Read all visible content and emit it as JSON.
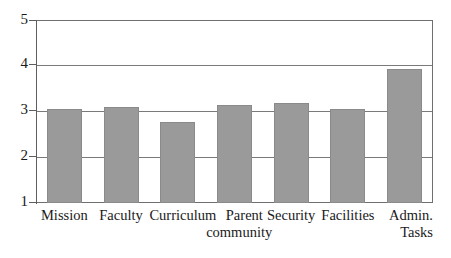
{
  "chart_data": {
    "type": "bar",
    "title": "",
    "subtitle": "",
    "xlabel": "",
    "ylabel": "",
    "categories": [
      "Mission",
      "Faculty",
      "Curriculum",
      "Parent\ncommunity",
      "Security",
      "Facilities",
      "Admin.\nTasks"
    ],
    "values": [
      3.05,
      3.1,
      2.78,
      3.15,
      3.18,
      3.05,
      3.92
    ],
    "ylim": [
      1,
      5
    ],
    "yticks": [
      1,
      2,
      3,
      4,
      5
    ],
    "ytick_labels": [
      "1",
      "2",
      "3",
      "4",
      "5"
    ],
    "grid": true,
    "grid_axis": "y",
    "legend": false,
    "legend_position": "none",
    "bar_color": "#9a9a9a",
    "bar_edge_color": "#8a8a8a",
    "axis_color": "#6f6f6f",
    "gridline_color": "#7a7a7a",
    "background_color": "#ffffff"
  },
  "axes": {
    "y_ticks": [
      {
        "label": "5",
        "value": 5
      },
      {
        "label": "4",
        "value": 4
      },
      {
        "label": "3",
        "value": 3
      },
      {
        "label": "2",
        "value": 2
      },
      {
        "label": "1",
        "value": 1
      }
    ]
  }
}
